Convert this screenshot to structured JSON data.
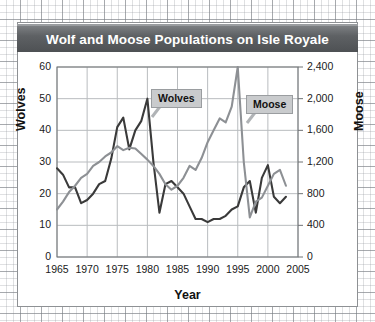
{
  "figure": {
    "title": "Wolf and Moose Populations on Isle Royale",
    "title_bg": "#5e6164",
    "frame_color": "#8e9194"
  },
  "chart_data": {
    "type": "line",
    "title": "Wolf and Moose Populations on Isle Royale",
    "xlabel": "Year",
    "ylabel": "Wolves",
    "ylabel_right": "Moose",
    "xlim": [
      1965,
      2005
    ],
    "ylim": [
      0,
      60
    ],
    "ylim_right": [
      0,
      2400
    ],
    "grid": true,
    "legend_position": "inline-callout",
    "x_ticks": [
      "1965",
      "1970",
      "1975",
      "1980",
      "1985",
      "1990",
      "1995",
      "2000",
      "2005"
    ],
    "y_ticks_left": [
      "0",
      "10",
      "20",
      "30",
      "40",
      "50",
      "60"
    ],
    "y_ticks_right": [
      "0",
      "400",
      "800",
      "1,200",
      "1,600",
      "2,000",
      "2,400"
    ],
    "x": [
      1965,
      1966,
      1967,
      1968,
      1969,
      1970,
      1971,
      1972,
      1973,
      1974,
      1975,
      1976,
      1977,
      1978,
      1979,
      1980,
      1981,
      1982,
      1983,
      1984,
      1985,
      1986,
      1987,
      1988,
      1989,
      1990,
      1991,
      1992,
      1993,
      1994,
      1995,
      1996,
      1997,
      1998,
      1999,
      2000,
      2001,
      2002,
      2003
    ],
    "series": [
      {
        "name": "Wolves",
        "axis": "left",
        "color": "#3a3a3a",
        "values": [
          28,
          26,
          22,
          22,
          17,
          18,
          20,
          23,
          24,
          31,
          41,
          44,
          34,
          40,
          43,
          50,
          30,
          14,
          23,
          24,
          22,
          20,
          16,
          12,
          12,
          11,
          12,
          12,
          13,
          15,
          16,
          22,
          24,
          14,
          25,
          29,
          19,
          17,
          19
        ]
      },
      {
        "name": "Moose",
        "axis": "right",
        "color": "#8d9094",
        "values": [
          600,
          700,
          820,
          900,
          1000,
          1050,
          1150,
          1200,
          1270,
          1320,
          1400,
          1350,
          1380,
          1370,
          1300,
          1230,
          1150,
          1050,
          920,
          850,
          900,
          1000,
          1150,
          1100,
          1250,
          1450,
          1600,
          1750,
          1700,
          1900,
          2400,
          1200,
          500,
          700,
          750,
          900,
          1050,
          1100,
          900
        ]
      }
    ],
    "annotations": [
      {
        "text": "Wolves",
        "points_to_series": "Wolves"
      },
      {
        "text": "Moose",
        "points_to_series": "Moose"
      }
    ]
  }
}
